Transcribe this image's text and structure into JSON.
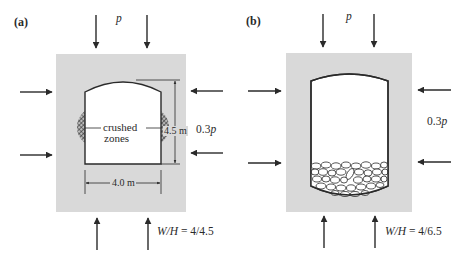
{
  "colors": {
    "rock": "#d9d9d9",
    "line": "#2a2a2a",
    "cavity": "#ffffff",
    "hatch": "#3a3a3a"
  },
  "panel_a": {
    "label": "(a)",
    "top_load": "p",
    "lateral_load": "0.3p",
    "crushed_label_line1": "crushed",
    "crushed_label_line2": "zones",
    "height_dim": "4.5 m",
    "width_dim": "4.0 m",
    "ratio_prefix": "W/H",
    "ratio_value": "= 4/4.5"
  },
  "panel_b": {
    "label": "(b)",
    "top_load": "p",
    "lateral_load": "0.3p",
    "ratio_prefix": "W/H",
    "ratio_value": "= 4/6.5"
  }
}
